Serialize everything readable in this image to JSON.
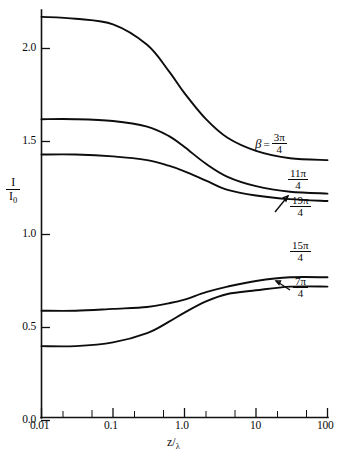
{
  "chart_data": {
    "type": "line",
    "title": "",
    "xlabel": "z/λ",
    "ylabel": "I/I₀",
    "xscale": "log",
    "xlim": [
      0.01,
      100
    ],
    "ylim": [
      0.0,
      2.25
    ],
    "grid": false,
    "legend_position": "inline-right",
    "x_tick_labels": [
      "0.01",
      "0.1",
      "1.0",
      "10",
      "100"
    ],
    "x_tick_values": [
      0.01,
      0.1,
      1.0,
      10,
      100
    ],
    "y_tick_labels": [
      "0.0",
      "0.5",
      "1.0",
      "1.5",
      "2.0"
    ],
    "y_tick_values": [
      0.0,
      0.5,
      1.0,
      1.5,
      2.0
    ],
    "series": [
      {
        "name": "beta = 3pi/4",
        "label_prefix": "β",
        "label_equals": "=",
        "label_numerator": "3π",
        "label_denominator": "4",
        "x": [
          0.01,
          0.03,
          0.1,
          0.3,
          0.6,
          1.0,
          2.0,
          4.0,
          10,
          30,
          100
        ],
        "values": [
          2.17,
          2.16,
          2.13,
          2.02,
          1.88,
          1.76,
          1.62,
          1.52,
          1.45,
          1.41,
          1.4
        ]
      },
      {
        "name": "beta = 11pi/4",
        "label_prefix": "",
        "label_equals": "",
        "label_numerator": "11π",
        "label_denominator": "4",
        "x": [
          0.01,
          0.03,
          0.1,
          0.3,
          0.6,
          1.0,
          2.0,
          4.0,
          10,
          30,
          100
        ],
        "values": [
          1.62,
          1.62,
          1.61,
          1.58,
          1.53,
          1.47,
          1.38,
          1.31,
          1.26,
          1.23,
          1.22
        ]
      },
      {
        "name": "beta = 19pi/4",
        "label_prefix": "",
        "label_equals": "",
        "label_numerator": "19π",
        "label_denominator": "4",
        "x": [
          0.01,
          0.03,
          0.1,
          0.3,
          0.6,
          1.0,
          2.0,
          4.0,
          10,
          30,
          100
        ],
        "values": [
          1.43,
          1.43,
          1.42,
          1.4,
          1.37,
          1.34,
          1.29,
          1.24,
          1.21,
          1.19,
          1.18
        ]
      },
      {
        "name": "beta = 15pi/4",
        "label_prefix": "",
        "label_equals": "",
        "label_numerator": "15π",
        "label_denominator": "4",
        "x": [
          0.01,
          0.03,
          0.1,
          0.3,
          0.6,
          1.0,
          2.0,
          4.0,
          10,
          30,
          100
        ],
        "values": [
          0.59,
          0.59,
          0.6,
          0.61,
          0.63,
          0.65,
          0.69,
          0.72,
          0.75,
          0.77,
          0.77
        ]
      },
      {
        "name": "beta = 7pi/4",
        "label_prefix": "",
        "label_equals": "",
        "label_numerator": "7π",
        "label_denominator": "4",
        "x": [
          0.01,
          0.03,
          0.1,
          0.3,
          0.6,
          1.0,
          2.0,
          4.0,
          10,
          30,
          100
        ],
        "values": [
          0.4,
          0.4,
          0.42,
          0.47,
          0.53,
          0.58,
          0.64,
          0.68,
          0.7,
          0.72,
          0.72
        ]
      }
    ]
  },
  "axes": {
    "y_title_numerator": "I",
    "y_title_denominator": "I",
    "y_title_denominator_sub": "0",
    "x_title_main": "z",
    "x_title_slash": "/",
    "x_title_sub": "λ"
  },
  "colors": {
    "line": "#0d0d0d",
    "axis": "#111111",
    "background": "#ffffff"
  }
}
